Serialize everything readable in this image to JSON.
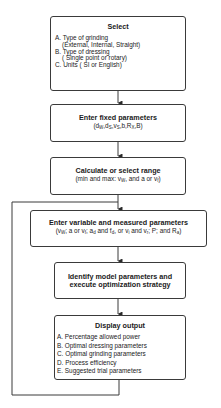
{
  "diagram": {
    "type": "flowchart",
    "boxes": [
      {
        "title": "Select",
        "items": [
          {
            "text": "A. Type of grinding",
            "detail": "(External, Internal, Straight)"
          },
          {
            "text": "B. Type of dressing",
            "detail": "( Single point or rotary)"
          },
          {
            "text": "C. Units ( SI or English)"
          }
        ]
      },
      {
        "title": "Enter fixed parameters",
        "subtitle": "(dW,dS,vS,b,RX,B)"
      },
      {
        "title": "Calculate or select range",
        "subtitle": "(min and max: vW, and a or vf)"
      },
      {
        "title": "Enter variable and measured parameters",
        "subtitle": "(vW; a or vf; ad and fd, or vi and vr; P; and Ra)"
      },
      {
        "title_line1": "Identify model parameters and",
        "title_line2": "execute optimization strategy"
      },
      {
        "title": "Display output",
        "items": [
          "A. Percentage allowed power",
          "B. Optimal dressing parameters",
          "C. Optimal grinding parameters",
          "D. Process efficiency",
          "E. Suggested trial parameters"
        ]
      }
    ],
    "loop": "Display output feeds back to Enter variable and measured parameters",
    "colors": {
      "line": "#3a3a3a",
      "background": "#ffffff",
      "text": "#1a1a1a"
    }
  }
}
